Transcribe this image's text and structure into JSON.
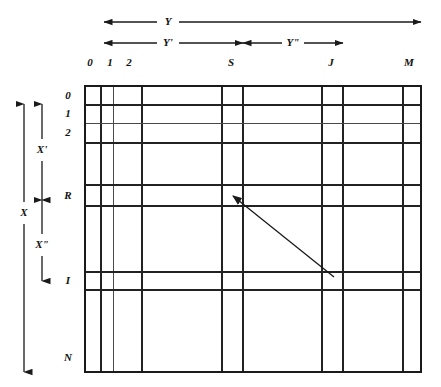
{
  "figure": {
    "type": "grid-diagram",
    "background_color": "#ffffff",
    "line_color": "#1a1a1a",
    "grid_color": "#4a4a4a"
  },
  "horizontal_dimensions": [
    {
      "id": "Y",
      "label": "Y",
      "from_x": 104,
      "to_x": 421,
      "y": 22,
      "start_arrow": "left",
      "end_arrow": "right",
      "label_x": 168
    },
    {
      "id": "Yp",
      "label": "Y'",
      "from_x": 104,
      "to_x": 243,
      "y": 43,
      "start_arrow": "left",
      "end_arrow": "right",
      "label_x": 168
    },
    {
      "id": "Ypp",
      "label": "Y\"",
      "from_x": 243,
      "to_x": 343,
      "y": 43,
      "start_arrow": "left",
      "end_arrow": "right",
      "label_x": 293
    }
  ],
  "vertical_dimensions": [
    {
      "id": "X",
      "label": "X",
      "x": 24,
      "from_y": 104,
      "to_y": 372,
      "start_arrow": "up",
      "end_arrow": "down",
      "label_y": 213
    },
    {
      "id": "Xp",
      "label": "X'",
      "x": 42,
      "from_y": 104,
      "to_y": 200,
      "start_arrow": "up",
      "end_arrow": "down",
      "label_y": 150
    },
    {
      "id": "Xpp",
      "label": "X\"",
      "x": 42,
      "from_y": 200,
      "to_y": 281,
      "start_arrow": "up",
      "end_arrow": "down",
      "label_y": 245
    }
  ],
  "column_labels": [
    {
      "label": "0",
      "x": 90,
      "y": 63
    },
    {
      "label": "1",
      "x": 110,
      "y": 63
    },
    {
      "label": "2",
      "x": 129,
      "y": 63
    },
    {
      "label": "S",
      "x": 231,
      "y": 63
    },
    {
      "label": "J",
      "x": 331,
      "y": 63
    },
    {
      "label": "M",
      "x": 409,
      "y": 63
    }
  ],
  "row_labels": [
    {
      "label": "0",
      "x": 68,
      "y": 96
    },
    {
      "label": "1",
      "x": 68,
      "y": 114
    },
    {
      "label": "2",
      "x": 68,
      "y": 133
    },
    {
      "label": "R",
      "x": 68,
      "y": 196
    },
    {
      "label": "I",
      "x": 68,
      "y": 281
    },
    {
      "label": "N",
      "x": 68,
      "y": 358
    }
  ],
  "grid": {
    "left": 85,
    "right": 421,
    "top": 86,
    "bottom": 372,
    "vertical_lines": [
      101,
      113,
      142,
      222,
      243,
      322,
      343,
      403
    ],
    "horizontal_lines": [
      105,
      123,
      143,
      185,
      206,
      272,
      290
    ],
    "major_vertical_lines": [
      101,
      142,
      222,
      243,
      322,
      343,
      403
    ],
    "major_horizontal_lines": [
      105,
      143,
      185,
      206,
      272,
      290
    ]
  },
  "flow_arrow": {
    "id": "cell-reference-arrow",
    "tail_x": 334,
    "tail_y": 277,
    "head_x": 233,
    "head_y": 196,
    "description": "arrow pointing from cell (I,J) region toward cell (R,S)"
  }
}
